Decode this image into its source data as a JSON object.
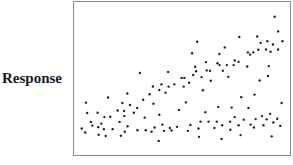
{
  "chart_data": {
    "type": "scatter",
    "title": "",
    "xlabel": "",
    "ylabel": "Response",
    "xlim": [
      0,
      100
    ],
    "ylim": [
      0,
      100
    ],
    "grid": false,
    "legend": null,
    "x_ticks": [],
    "y_ticks": [],
    "point_color": "#222222",
    "points": [
      [
        3.6,
        17.3
      ],
      [
        5.2,
        14.7
      ],
      [
        5.5,
        34.2
      ],
      [
        6.1,
        27.4
      ],
      [
        7.8,
        21.6
      ],
      [
        8.5,
        19.2
      ],
      [
        10.9,
        27.6
      ],
      [
        11.2,
        18.2
      ],
      [
        11.4,
        13.2
      ],
      [
        12.6,
        20.5
      ],
      [
        13.8,
        16.9
      ],
      [
        14.1,
        24.8
      ],
      [
        14.7,
        12.4
      ],
      [
        15.8,
        37.6
      ],
      [
        16.8,
        25.0
      ],
      [
        17.9,
        16.9
      ],
      [
        20.2,
        29.1
      ],
      [
        21.1,
        21.6
      ],
      [
        21.7,
        12.6
      ],
      [
        22.4,
        34.0
      ],
      [
        23.2,
        28.8
      ],
      [
        23.3,
        25.4
      ],
      [
        23.5,
        15.2
      ],
      [
        24.7,
        40.2
      ],
      [
        24.8,
        18.8
      ],
      [
        25.9,
        32.7
      ],
      [
        27.7,
        27.6
      ],
      [
        29.2,
        30.8
      ],
      [
        29.4,
        16.2
      ],
      [
        30.5,
        53.6
      ],
      [
        32.0,
        36.1
      ],
      [
        32.7,
        24.4
      ],
      [
        33.2,
        16.2
      ],
      [
        35.0,
        39.7
      ],
      [
        35.9,
        15.2
      ],
      [
        36.5,
        44.8
      ],
      [
        36.8,
        33.5
      ],
      [
        37.3,
        18.0
      ],
      [
        39.2,
        9.2
      ],
      [
        39.5,
        42.5
      ],
      [
        39.5,
        26.3
      ],
      [
        40.5,
        46.2
      ],
      [
        40.9,
        19.9
      ],
      [
        41.7,
        15.8
      ],
      [
        42.4,
        40.8
      ],
      [
        43.6,
        54.3
      ],
      [
        43.8,
        44.7
      ],
      [
        44.4,
        17.7
      ],
      [
        45.2,
        16.0
      ],
      [
        46.4,
        46.2
      ],
      [
        47.7,
        18.4
      ],
      [
        48.6,
        29.5
      ],
      [
        49.8,
        50.4
      ],
      [
        50.8,
        44.7
      ],
      [
        51.1,
        50.4
      ],
      [
        51.8,
        34.4
      ],
      [
        52.7,
        15.8
      ],
      [
        53.3,
        47.2
      ],
      [
        53.9,
        19.6
      ],
      [
        54.7,
        66.5
      ],
      [
        55.2,
        52.3
      ],
      [
        56.1,
        57.7
      ],
      [
        56.5,
        54.7
      ],
      [
        57.0,
        74.0
      ],
      [
        57.6,
        17.3
      ],
      [
        57.9,
        11.9
      ],
      [
        58.6,
        21.8
      ],
      [
        59.1,
        50.9
      ],
      [
        59.7,
        42.3
      ],
      [
        60.8,
        28.0
      ],
      [
        61.1,
        60.7
      ],
      [
        61.4,
        55.3
      ],
      [
        62.3,
        21.8
      ],
      [
        63.0,
        55.1
      ],
      [
        63.3,
        48.5
      ],
      [
        65.0,
        17.7
      ],
      [
        66.1,
        21.8
      ],
      [
        66.4,
        60.0
      ],
      [
        66.8,
        31.4
      ],
      [
        67.3,
        66.0
      ],
      [
        67.4,
        58.8
      ],
      [
        68.3,
        10.5
      ],
      [
        68.6,
        19.4
      ],
      [
        68.9,
        55.1
      ],
      [
        69.8,
        70.3
      ],
      [
        70.8,
        58.8
      ],
      [
        71.4,
        51.1
      ],
      [
        72.3,
        21.8
      ],
      [
        72.4,
        16.5
      ],
      [
        73.0,
        31.0
      ],
      [
        73.9,
        58.8
      ],
      [
        74.4,
        61.8
      ],
      [
        74.4,
        24.8
      ],
      [
        76.2,
        60.9
      ],
      [
        76.2,
        19.4
      ],
      [
        76.5,
        77.1
      ],
      [
        77.1,
        13.0
      ],
      [
        77.4,
        37.8
      ],
      [
        78.6,
        23.1
      ],
      [
        80.2,
        57.9
      ],
      [
        80.5,
        67.1
      ],
      [
        80.8,
        30.8
      ],
      [
        81.5,
        65.6
      ],
      [
        81.8,
        19.9
      ],
      [
        83.0,
        67.1
      ],
      [
        83.3,
        18.0
      ],
      [
        83.6,
        39.5
      ],
      [
        84.1,
        23.5
      ],
      [
        84.8,
        77.4
      ],
      [
        85.3,
        68.8
      ],
      [
        85.9,
        48.7
      ],
      [
        86.4,
        73.3
      ],
      [
        87.0,
        25.4
      ],
      [
        87.7,
        19.4
      ],
      [
        88.9,
        69.0
      ],
      [
        89.2,
        23.3
      ],
      [
        89.5,
        74.4
      ],
      [
        89.8,
        51.7
      ],
      [
        90.2,
        58.1
      ],
      [
        90.8,
        26.9
      ],
      [
        91.0,
        67.5
      ],
      [
        91.5,
        12.2
      ],
      [
        92.1,
        72.2
      ],
      [
        92.3,
        21.2
      ],
      [
        92.9,
        90.4
      ],
      [
        94.1,
        23.7
      ],
      [
        94.5,
        69.0
      ],
      [
        94.5,
        80.8
      ],
      [
        95.5,
        19.0
      ],
      [
        96.1,
        34.0
      ],
      [
        96.5,
        74.4
      ]
    ]
  }
}
